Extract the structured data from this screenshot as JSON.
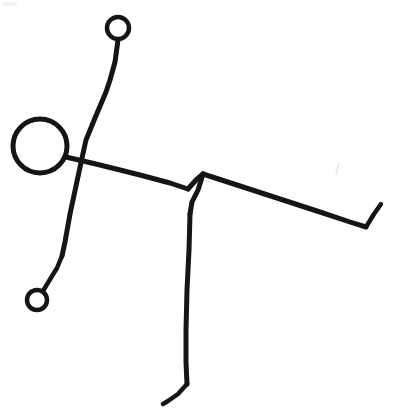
{
  "canvas": {
    "width": 393,
    "height": 414,
    "background_color": "#ffffff",
    "ink_color": "#151515",
    "smudge_color": "#e9e9ec",
    "title": "Hand-drawn stick figure sketch",
    "medium": "ink line drawing on white paper"
  },
  "figure": {
    "head": {
      "name": "head-circle",
      "cx": 40,
      "cy": 146,
      "r": 27,
      "stroke_width": 5
    },
    "raised_hand": {
      "name": "upper-hand-circle",
      "cx": 118,
      "cy": 28,
      "r": 11,
      "stroke_width": 4.5
    },
    "lower_hand": {
      "name": "lower-hand-circle",
      "cx": 37,
      "cy": 300,
      "r": 10,
      "stroke_width": 4.5
    },
    "strokes": [
      {
        "name": "upper-arm-stroke",
        "label": "Upper arm from raised hand down through the body",
        "stroke_width": 5,
        "points": "118,40 115,62 110,80 106,92 95,118 86,140 82,158 76,186 70,214 65,242 62,256"
      },
      {
        "name": "lower-arm-stroke",
        "label": "Lower arm from body down to lowered hand",
        "stroke_width": 4.5,
        "points": "62,256 57,268 49,281 43,291"
      },
      {
        "name": "shoulder-torso-stroke",
        "label": "Horizontal shoulder line from head across to hip junction",
        "stroke_width": 5,
        "points": "66,157 100,165 140,175 170,183 188,189"
      },
      {
        "name": "hip-peak-stroke",
        "label": "Short rise from shoulder line up to the hip peak",
        "stroke_width": 5,
        "points": "188,189 196,180 203,174"
      },
      {
        "name": "outstretched-limb-stroke",
        "label": "Long limb extending right and downward",
        "stroke_width": 5,
        "points": "203,174 240,186 280,199 320,212 350,222 366,227"
      },
      {
        "name": "outstretched-limb-tip-stroke",
        "label": "Upturned tip at the end of the right limb",
        "stroke_width": 4.5,
        "points": "366,227 374,214 381,204"
      },
      {
        "name": "hip-drop-stroke",
        "label": "Short drop from the hip peak down the thigh",
        "stroke_width": 5,
        "points": "203,174 198,190 192,202 190,214"
      },
      {
        "name": "leg-stroke",
        "label": "Long leg descending to the foot",
        "stroke_width": 5,
        "points": "190,214 189,250 187,290 186,330 186,362 187,384"
      },
      {
        "name": "foot-stroke",
        "label": "Foot angling down and to the left",
        "stroke_width": 4.5,
        "points": "187,384 178,394 168,401 163,404"
      }
    ]
  },
  "artifacts": [
    {
      "name": "corner-smudge",
      "label": "Faint gray smudge at the top-left corner of the paper",
      "type": "rect",
      "x": 3,
      "y": 2,
      "width": 14,
      "height": 4,
      "opacity": 0.55
    },
    {
      "name": "stray-pen-mark",
      "label": "Faint stray pen tick on the right side",
      "type": "line",
      "points": "339,163 336,174",
      "stroke_width": 1.6,
      "opacity": 0.8
    }
  ]
}
